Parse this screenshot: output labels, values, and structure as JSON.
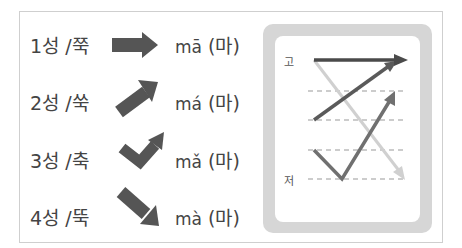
{
  "tones": [
    {
      "label": "1성 /쭉",
      "pinyin": "mā",
      "hangul": "(마)",
      "arrow": "right-arrow"
    },
    {
      "label": "2성 /쑥",
      "pinyin": "má",
      "hangul": "(마)",
      "arrow": "up-right-arrow"
    },
    {
      "label": "3성 /축",
      "pinyin": "mǎ",
      "hangul": "(마)",
      "arrow": "dip-rise-arrow"
    },
    {
      "label": "4성 /뚝",
      "pinyin": "mà",
      "hangul": "(마)",
      "arrow": "down-right-arrow"
    }
  ],
  "pitch_diagram": {
    "high_label": "고",
    "low_label": "저",
    "colors": {
      "tone1": "#4a4a4a",
      "tone2": "#5a5a5a",
      "tone3": "#6e6e6e",
      "tone4": "#cfcfcf",
      "frame": "#d6d6d6",
      "dash": "#999999"
    }
  }
}
